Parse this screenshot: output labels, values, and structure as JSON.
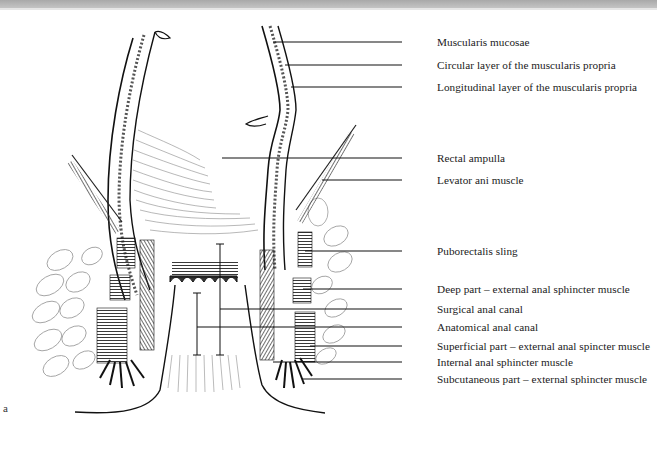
{
  "figure": {
    "panel_letter": "a",
    "labels": [
      {
        "text": "Muscularis mucosae",
        "y": 42
      },
      {
        "text": "Circular layer of the muscularis propria",
        "y": 65
      },
      {
        "text": "Longitudinal layer of the muscularis propria",
        "y": 87
      },
      {
        "text": "Rectal ampulla",
        "y": 158
      },
      {
        "text": "Levator ani muscle",
        "y": 180
      },
      {
        "text": "Puborectalis sling",
        "y": 251
      },
      {
        "text": "Deep part – external anal sphincter muscle",
        "y": 289
      },
      {
        "text": "Surgical anal canal",
        "y": 309
      },
      {
        "text": "Anatomical anal canal",
        "y": 327
      },
      {
        "text": "Superficial part – external anal spincter muscle",
        "y": 346
      },
      {
        "text": "Internal anal sphincter muscle",
        "y": 362
      },
      {
        "text": "Subcutaneous part – external sphincter muscle",
        "y": 379
      }
    ]
  },
  "colors": {
    "ink": "#1a1a1a",
    "topbar": "#b5b5b5",
    "background": "#ffffff"
  }
}
